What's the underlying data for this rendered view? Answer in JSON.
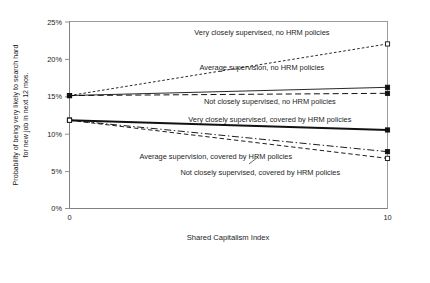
{
  "chart_data": {
    "type": "line",
    "title": "",
    "xlabel": "Shared Capitalism Index",
    "ylabel": "Probability of being very likely to search hard for new job in next 12 mos.",
    "x": [
      0,
      10
    ],
    "xlim": [
      0,
      10
    ],
    "ylim": [
      0,
      25
    ],
    "xticks": [
      "0",
      "10"
    ],
    "yticks": [
      "0%",
      "5%",
      "10%",
      "15%",
      "20%",
      "25%"
    ],
    "ytick_values": [
      0,
      5,
      10,
      15,
      20,
      25
    ],
    "grid": false,
    "legend_position": "inline-labels",
    "y_unit": "percent",
    "series": [
      {
        "name": "Very closely supervised, no HRM policies",
        "values": [
          15.1,
          22.0
        ],
        "style": "fine-dashed",
        "marker": "open-square",
        "label_x": 6.05,
        "label_y": 23.2
      },
      {
        "name": "Average supervision, no HRM policies",
        "values": [
          15.1,
          16.2
        ],
        "style": "thin-solid",
        "marker": "solid-square",
        "label_x": 6.05,
        "label_y": 18.45
      },
      {
        "name": "Not closely supervised, no HRM policies",
        "values": [
          15.1,
          15.4
        ],
        "style": "long-dash",
        "marker": "solid-square",
        "label_x": 6.3,
        "label_y": 13.95
      },
      {
        "name": "Very closely supervised, covered by HRM policies",
        "values": [
          11.8,
          10.5
        ],
        "style": "thick-solid",
        "marker": "solid-square",
        "label_x": 6.3,
        "label_y": 11.6
      },
      {
        "name": "Average supervision, covered by HRM policies",
        "values": [
          11.8,
          7.6
        ],
        "style": "dash-dot",
        "marker": "solid-square",
        "label_x": 4.6,
        "label_y": 6.6
      },
      {
        "name": "Not closely supervised, covered by HRM policies",
        "values": [
          11.8,
          6.7
        ],
        "style": "dashed",
        "marker": "open-square",
        "label_x": 6.0,
        "label_y": 4.5
      }
    ]
  }
}
